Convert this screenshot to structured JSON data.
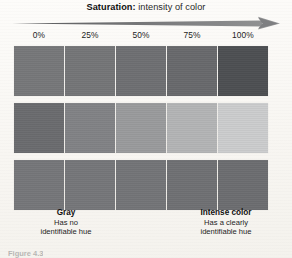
{
  "header": {
    "title_strong": "Saturation:",
    "title_rest": " intensity of color",
    "arrow_icon": "right-arrow-icon"
  },
  "scale": {
    "labels": [
      "0%",
      "25%",
      "50%",
      "75%",
      "100%"
    ]
  },
  "swatches": {
    "rows": [
      {
        "name": "row-1",
        "cells": [
          {
            "label": "0%",
            "color": "#77787a"
          },
          {
            "label": "25%",
            "color": "#757678"
          },
          {
            "label": "50%",
            "color": "#6f7073"
          },
          {
            "label": "75%",
            "color": "#696a6d"
          },
          {
            "label": "100%",
            "color": "#4e5053"
          }
        ]
      },
      {
        "name": "row-2",
        "cells": [
          {
            "label": "0%",
            "color": "#6b6c6f"
          },
          {
            "label": "25%",
            "color": "#828386"
          },
          {
            "label": "50%",
            "color": "#9a9b9d"
          },
          {
            "label": "75%",
            "color": "#b4b5b6"
          },
          {
            "label": "100%",
            "color": "#cccdce"
          }
        ]
      },
      {
        "name": "row-3",
        "cells": [
          {
            "label": "0%",
            "color": "#76777a"
          },
          {
            "label": "25%",
            "color": "#76777a"
          },
          {
            "label": "50%",
            "color": "#747578"
          },
          {
            "label": "75%",
            "color": "#707174"
          },
          {
            "label": "100%",
            "color": "#6d6e71"
          }
        ]
      }
    ]
  },
  "captions": {
    "left": {
      "title": "Gray",
      "line1": "Has no",
      "line2": "identifiable hue"
    },
    "right": {
      "title": "Intense color",
      "line1": "Has a clearly",
      "line2": "identifiable hue"
    }
  },
  "figure_caption": "Figure 4.3",
  "colors": {
    "background": "#fbfaf7",
    "arrow": "#6d6e70",
    "text": "#1c1c1c"
  }
}
